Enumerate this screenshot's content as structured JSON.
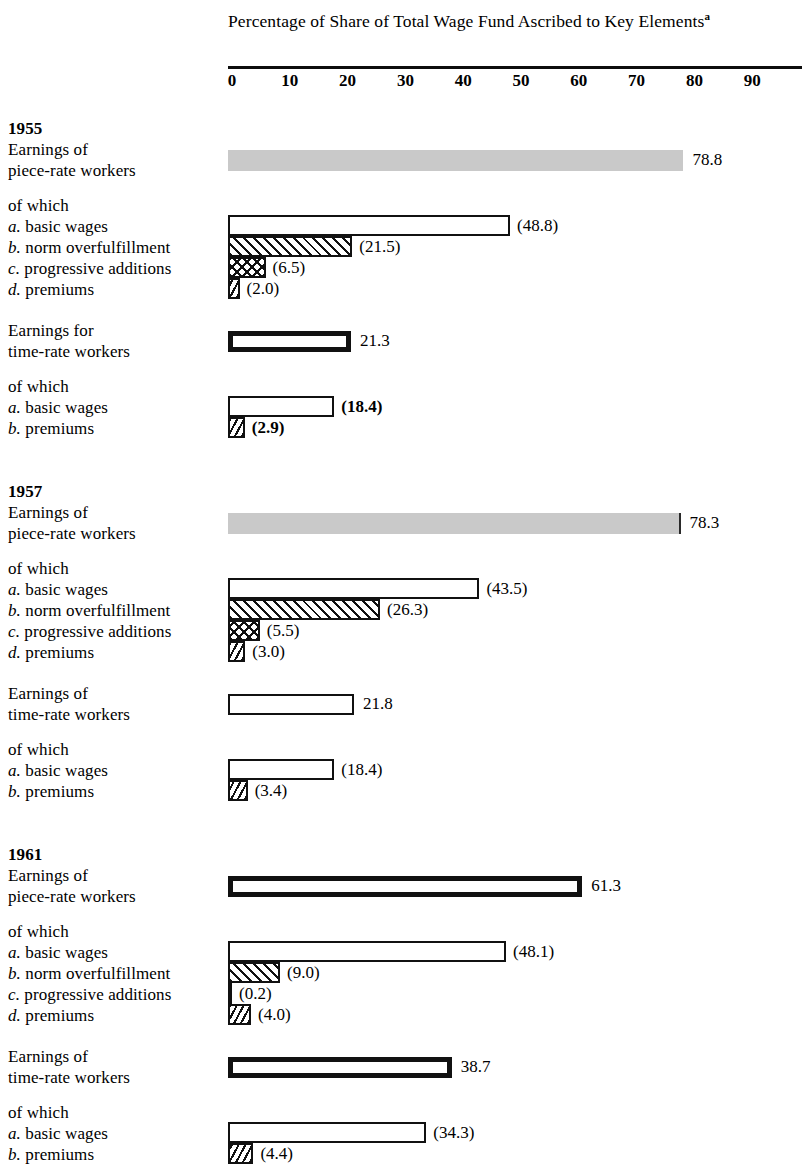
{
  "chart_data": {
    "type": "bar",
    "title": "Percentage of Share of Total Wage Fund Ascribed to Key Elements",
    "title_superscript": "a",
    "xlabel": "",
    "ylabel": "",
    "xlim": [
      0,
      100
    ],
    "xticks": [
      0,
      10,
      20,
      30,
      40,
      50,
      60,
      70,
      80,
      90
    ],
    "xtick_labels": [
      "0",
      "10",
      "20",
      "30",
      "40",
      "50",
      "60",
      "70",
      "80",
      "90"
    ],
    "grid": false,
    "legend": "none",
    "orientation": "horizontal",
    "of_which_label": "of which",
    "sections": [
      {
        "year": "1955",
        "groups": [
          {
            "label_lines": [
              "Earnings of",
              "piece-rate workers"
            ],
            "total": {
              "value": 78.8,
              "label": "78.8",
              "style": "gray",
              "bold_label": false
            },
            "components": [
              {
                "prefix": "a.",
                "name": "basic wages",
                "value": 48.8,
                "label": "(48.8)",
                "style": "outline",
                "bold_label": false
              },
              {
                "prefix": "b.",
                "name": "norm overfulfillment",
                "value": 21.5,
                "label": "(21.5)",
                "style": "hatch",
                "bold_label": false
              },
              {
                "prefix": "c.",
                "name": "progressive additions",
                "value": 6.5,
                "label": "(6.5)",
                "style": "cross",
                "bold_label": false
              },
              {
                "prefix": "d.",
                "name": "premiums",
                "value": 2.0,
                "label": "(2.0)",
                "style": "back",
                "bold_label": false
              }
            ]
          },
          {
            "label_lines": [
              "Earnings for",
              "time-rate workers"
            ],
            "total": {
              "value": 21.3,
              "label": "21.3",
              "style": "heavy",
              "bold_label": false
            },
            "components": [
              {
                "prefix": "a.",
                "name": "basic wages",
                "value": 18.4,
                "label": "(18.4)",
                "style": "outline",
                "bold_label": true
              },
              {
                "prefix": "b.",
                "name": "premiums",
                "value": 2.9,
                "label": "(2.9)",
                "style": "back",
                "bold_label": true
              }
            ]
          }
        ]
      },
      {
        "year": "1957",
        "groups": [
          {
            "label_lines": [
              "Earnings of",
              "piece-rate workers"
            ],
            "total": {
              "value": 78.3,
              "label": "78.3",
              "style": "gray-edge",
              "bold_label": false
            },
            "components": [
              {
                "prefix": "a.",
                "name": "basic wages",
                "value": 43.5,
                "label": "(43.5)",
                "style": "outline",
                "bold_label": false
              },
              {
                "prefix": "b.",
                "name": "norm overfulfillment",
                "value": 26.3,
                "label": "(26.3)",
                "style": "hatch",
                "bold_label": false
              },
              {
                "prefix": "c.",
                "name": "progressive additions",
                "value": 5.5,
                "label": "(5.5)",
                "style": "cross",
                "bold_label": false
              },
              {
                "prefix": "d.",
                "name": "premiums",
                "value": 3.0,
                "label": "(3.0)",
                "style": "back",
                "bold_label": false
              }
            ]
          },
          {
            "label_lines": [
              "Earnings of",
              "time-rate workers"
            ],
            "total": {
              "value": 21.8,
              "label": "21.8",
              "style": "outline",
              "bold_label": false
            },
            "components": [
              {
                "prefix": "a.",
                "name": "basic wages",
                "value": 18.4,
                "label": "(18.4)",
                "style": "outline",
                "bold_label": false
              },
              {
                "prefix": "b.",
                "name": "premiums",
                "value": 3.4,
                "label": "(3.4)",
                "style": "back",
                "bold_label": false
              }
            ]
          }
        ]
      },
      {
        "year": "1961",
        "groups": [
          {
            "label_lines": [
              "Earnings of",
              "piece-rate workers"
            ],
            "total": {
              "value": 61.3,
              "label": "61.3",
              "style": "heavy",
              "bold_label": false
            },
            "components": [
              {
                "prefix": "a.",
                "name": "basic wages",
                "value": 48.1,
                "label": "(48.1)",
                "style": "outline",
                "bold_label": false
              },
              {
                "prefix": "b.",
                "name": "norm overfulfillment",
                "value": 9.0,
                "label": "(9.0)",
                "style": "hatch",
                "bold_label": false
              },
              {
                "prefix": "c.",
                "name": "progressive additions",
                "value": 0.2,
                "label": "(0.2)",
                "style": "hair",
                "bold_label": false
              },
              {
                "prefix": "d.",
                "name": "premiums",
                "value": 4.0,
                "label": "(4.0)",
                "style": "back",
                "bold_label": false
              }
            ]
          },
          {
            "label_lines": [
              "Earnings of",
              "time-rate workers"
            ],
            "total": {
              "value": 38.7,
              "label": "38.7",
              "style": "heavy",
              "bold_label": false
            },
            "components": [
              {
                "prefix": "a.",
                "name": "basic wages",
                "value": 34.3,
                "label": "(34.3)",
                "style": "outline",
                "bold_label": false
              },
              {
                "prefix": "b.",
                "name": "premiums",
                "value": 4.4,
                "label": "(4.4)",
                "style": "back",
                "bold_label": false
              }
            ]
          }
        ]
      }
    ]
  }
}
